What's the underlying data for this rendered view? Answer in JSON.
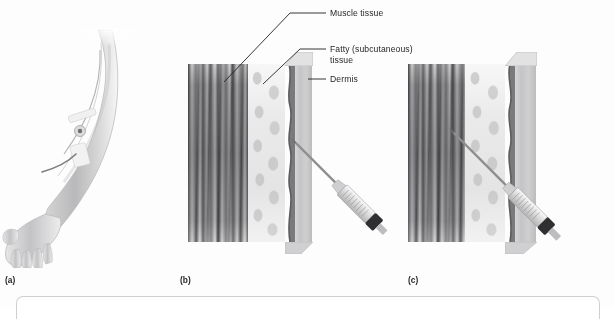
{
  "figure": {
    "background_color": "#fdfdfd",
    "ink_color": "#231f20",
    "style": "grayscale medical illustration"
  },
  "callouts": [
    {
      "id": "muscle",
      "label": "Muscle tissue",
      "target": "muscle-layer"
    },
    {
      "id": "fatty",
      "label": "Fatty (subcutaneous)\ntissue",
      "target": "fat-layer"
    },
    {
      "id": "dermis",
      "label": "Dermis",
      "target": "dermis-layer"
    }
  ],
  "panels": [
    {
      "letter": "(a)",
      "name": "arm-with-iv-catheter",
      "content": "forearm and hand with intravenous catheter taped at the antecubital site"
    },
    {
      "letter": "(b)",
      "name": "subcutaneous-injection",
      "content": "tissue cross-section with needle entering at a shallow angle into the subcutaneous fat",
      "needle_angle_deg": 45,
      "needle_depth": "subcutaneous"
    },
    {
      "letter": "(c)",
      "name": "intramuscular-injection",
      "content": "tissue cross-section with needle passing through skin and fat into the muscle",
      "needle_angle_deg": 45,
      "needle_depth": "intramuscular"
    }
  ],
  "tissue_layers": [
    {
      "name": "muscle tissue",
      "appearance": "dark vertical striations"
    },
    {
      "name": "fatty (subcutaneous) tissue",
      "appearance": "pale rounded adipocyte cells"
    },
    {
      "name": "dermis",
      "appearance": "dark wavy band"
    },
    {
      "name": "skin surface",
      "appearance": "smooth grey outer face"
    }
  ],
  "syringe": {
    "name": "syringe-with-needle",
    "parts": [
      "needle",
      "hub",
      "graduated barrel",
      "plunger stopper"
    ]
  }
}
